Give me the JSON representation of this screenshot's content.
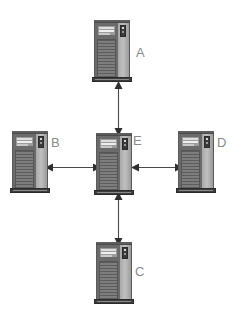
{
  "diagram": {
    "background_color": "#ffffff",
    "label_color": "#8a8a8a",
    "connector_color": "#4a4a4a",
    "nodes": [
      {
        "id": "A",
        "label": "A",
        "role": "server-tower",
        "position": "top",
        "x": 94,
        "y": 20,
        "label_x": 136,
        "label_y": 46
      },
      {
        "id": "B",
        "label": "B",
        "role": "server-tower",
        "position": "left",
        "x": 12,
        "y": 131,
        "label_x": 51,
        "label_y": 136
      },
      {
        "id": "E",
        "label": "E",
        "role": "server-tower",
        "position": "center",
        "x": 96,
        "y": 133,
        "label_x": 133,
        "label_y": 134
      },
      {
        "id": "D",
        "label": "D",
        "role": "server-tower",
        "position": "right",
        "x": 178,
        "y": 131,
        "label_x": 217,
        "label_y": 136
      },
      {
        "id": "C",
        "label": "C",
        "role": "server-tower",
        "position": "bottom",
        "x": 96,
        "y": 242,
        "label_x": 135,
        "label_y": 265
      }
    ],
    "connections": [
      {
        "id": "A-E",
        "from": "A",
        "to": "E",
        "orientation": "vertical",
        "arrowheads": "both",
        "x": 114,
        "y": 81,
        "length": 53
      },
      {
        "id": "B-E",
        "from": "B",
        "to": "E",
        "orientation": "horizontal",
        "arrowheads": "both",
        "x": 45,
        "y": 163,
        "length": 54
      },
      {
        "id": "E-D",
        "from": "E",
        "to": "D",
        "orientation": "horizontal",
        "arrowheads": "both",
        "x": 131,
        "y": 163,
        "length": 50
      },
      {
        "id": "C-E",
        "from": "C",
        "to": "E",
        "orientation": "vertical",
        "arrowheads": "both",
        "x": 114,
        "y": 192,
        "length": 52
      }
    ]
  }
}
